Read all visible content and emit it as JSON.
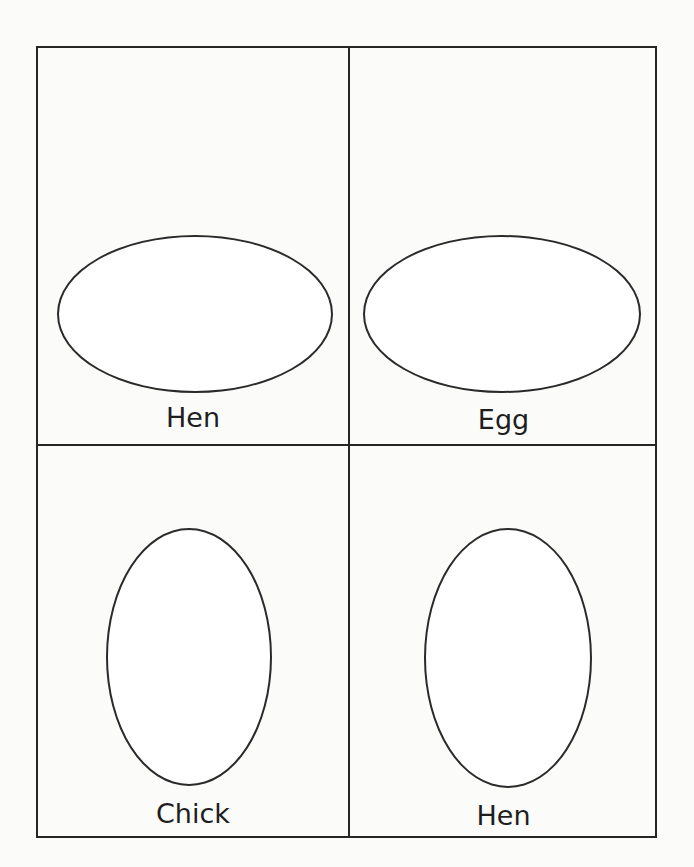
{
  "worksheet": {
    "cells": [
      {
        "label": "Hen",
        "shape": "horizontal-oval"
      },
      {
        "label": "Egg",
        "shape": "horizontal-oval"
      },
      {
        "label": "Chick",
        "shape": "vertical-oval"
      },
      {
        "label": "Hen",
        "shape": "vertical-oval"
      }
    ]
  }
}
